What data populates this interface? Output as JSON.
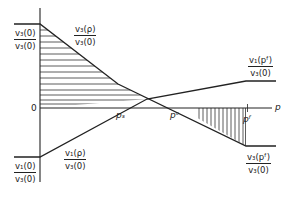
{
  "diagram": {
    "axis": {
      "x_label": "p",
      "origin_label": "0"
    },
    "points": {
      "ps": "pₛ",
      "pc": "pᶜ",
      "pf": "pᶠ"
    },
    "point_labels": {
      "ps": "ps",
      "pc": "pc",
      "pf": "pf"
    },
    "fractions": {
      "v3_0_over_v3_0": {
        "num": "v₃(0)",
        "den": "v₃(0)"
      },
      "v3_p_over_v3_0": {
        "num": "v₃(ρ)",
        "den": "v₃(0)"
      },
      "v1_pf_over_v3_0": {
        "num": "v₁(pᶠ)",
        "den": "v₃(0)"
      },
      "v1_p_over_v3_0": {
        "num": "v₁(ρ)",
        "den": "v₃(0)"
      },
      "v1_0_over_v3_0": {
        "num": "v₁(0)",
        "den": "v₃(0)"
      },
      "v3_pf_over_v3_0": {
        "num": "v₃(pᶠ)",
        "den": "v₃(0)"
      }
    },
    "colors": {
      "line": "#222222",
      "hatch": "#333333",
      "background": "#ffffff"
    }
  }
}
